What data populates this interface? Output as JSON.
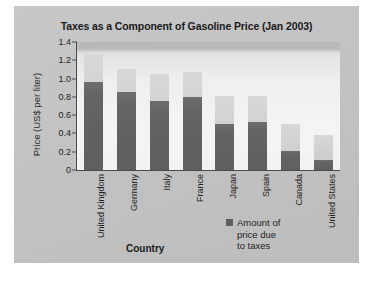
{
  "figure": {
    "panel_color": "#c3c3c3",
    "plot_background": "#f2f2f2"
  },
  "chart_data": {
    "type": "bar",
    "subtype": "stacked",
    "title": "Taxes as a Component of Gasoline Price (Jan 2003)",
    "xlabel": "Country",
    "ylabel": "Price (US$ per liter)",
    "categories": [
      "United Kingdom",
      "Germany",
      "Italy",
      "France",
      "Japan",
      "Spain",
      "Canada",
      "United States"
    ],
    "series": [
      {
        "name": "Amount of price due to taxes",
        "color": "#5f5f5f",
        "values": [
          0.96,
          0.85,
          0.75,
          0.8,
          0.5,
          0.52,
          0.21,
          0.11
        ]
      },
      {
        "name": "Remainder of price",
        "color": "#d2d2d2",
        "values": [
          0.31,
          0.26,
          0.3,
          0.27,
          0.31,
          0.29,
          0.29,
          0.27
        ]
      }
    ],
    "totals": [
      1.27,
      1.11,
      1.05,
      1.07,
      0.81,
      0.81,
      0.5,
      0.38
    ],
    "ylim": [
      0,
      1.4
    ],
    "yticks": [
      "0",
      "0.2",
      "0.4",
      "0.6",
      "0.8",
      "1.0",
      "1.2",
      "1.4"
    ],
    "ytick_values": [
      0,
      0.2,
      0.4,
      0.6,
      0.8,
      1.0,
      1.2,
      1.4
    ],
    "grid": false,
    "legend_position": "bottom-right",
    "legend_entries": [
      "Amount of\nprice due\nto taxes"
    ]
  }
}
